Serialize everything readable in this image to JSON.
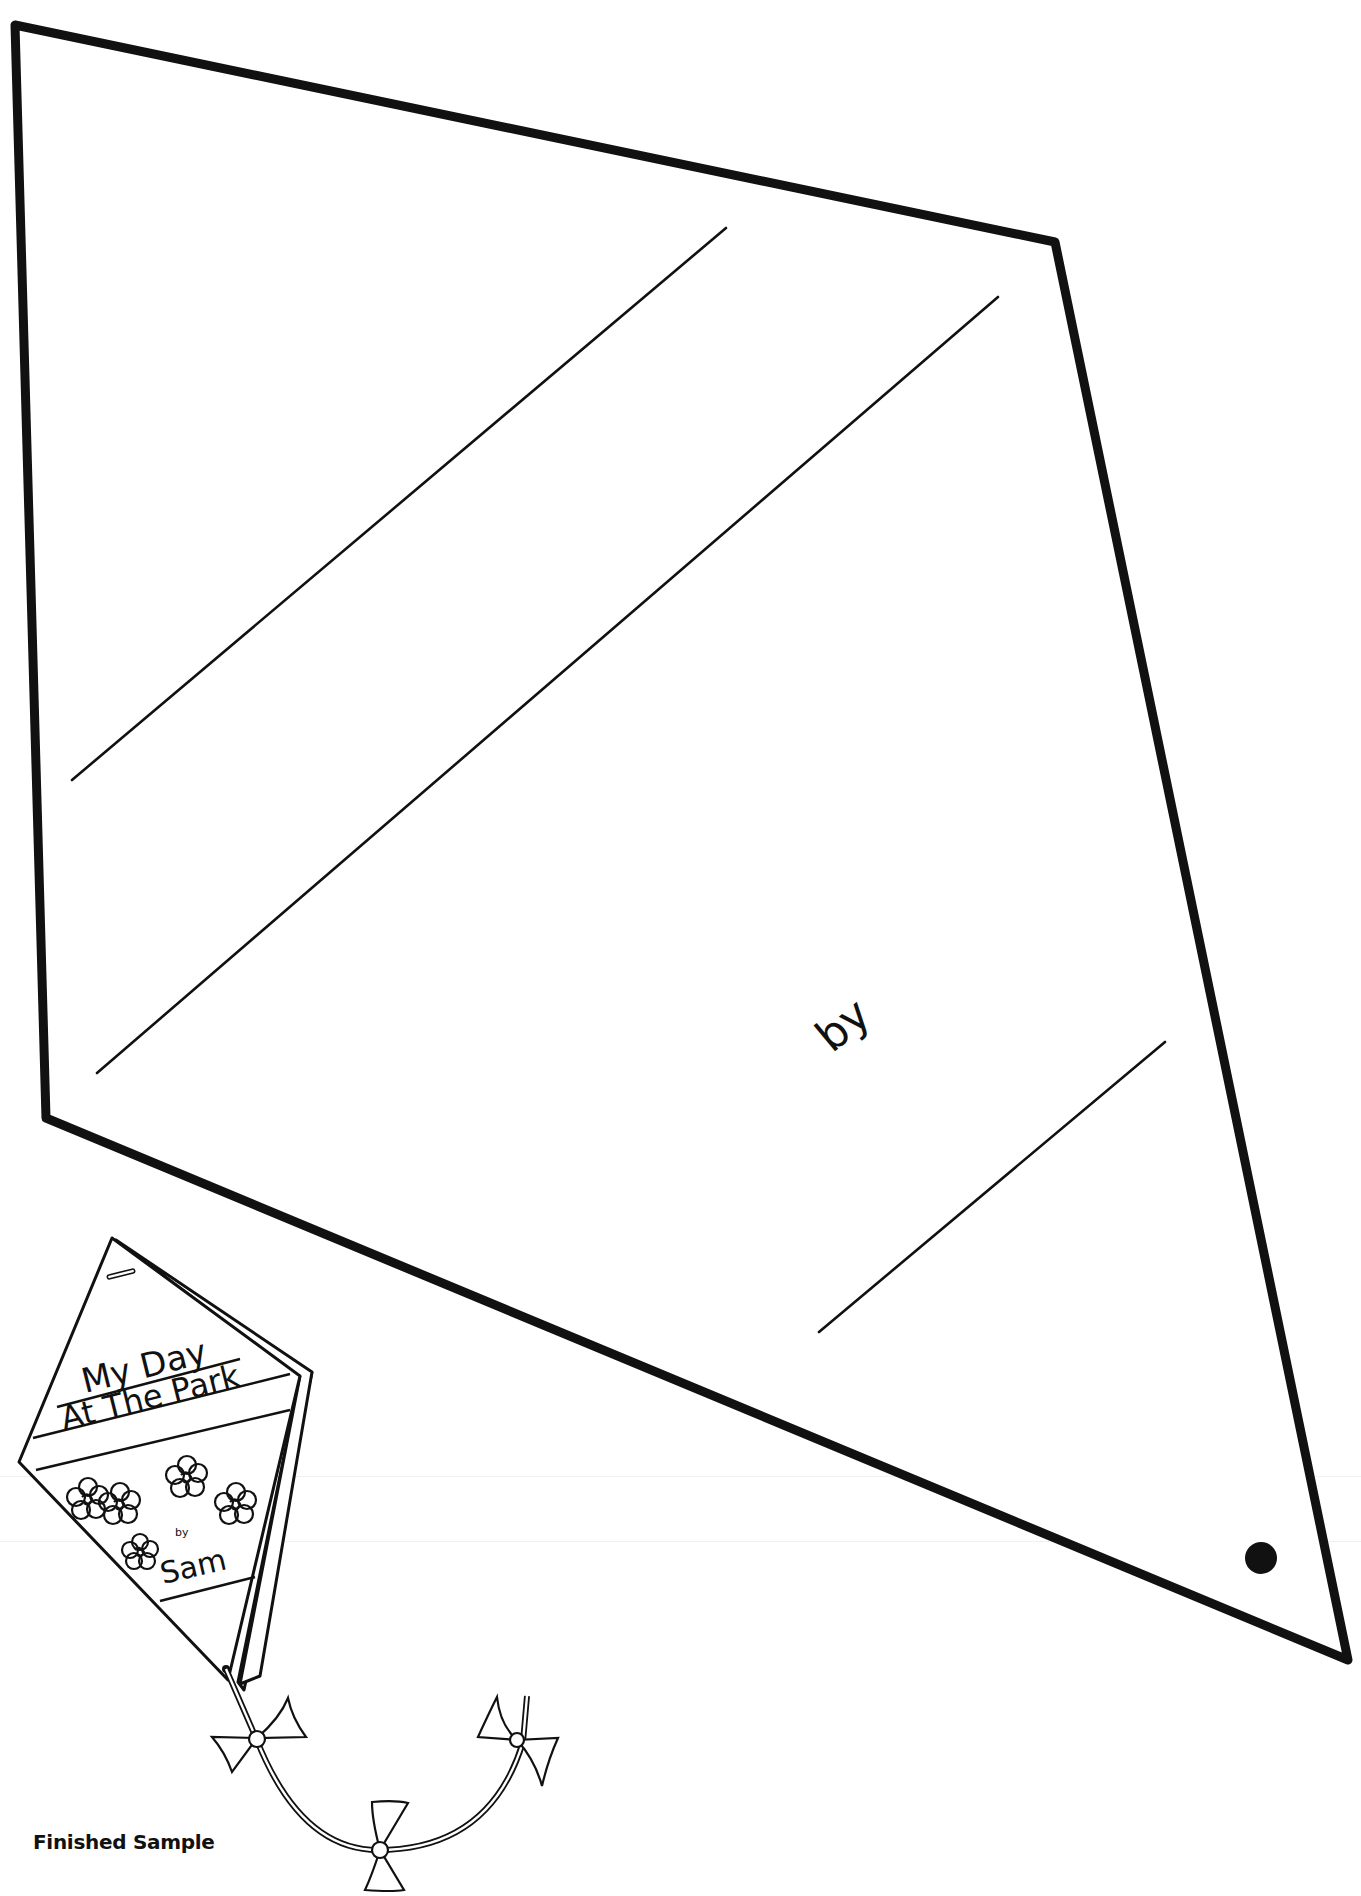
{
  "template": {
    "title_line_count": 2,
    "by_label": "by",
    "hole_marker": "punch-hole"
  },
  "sample": {
    "title_line1": "My Day",
    "title_line2": "At The Park",
    "by_label": "by",
    "author": "Sam",
    "caption": "Finished Sample"
  },
  "colors": {
    "ink": "#111111",
    "paper": "#ffffff"
  }
}
